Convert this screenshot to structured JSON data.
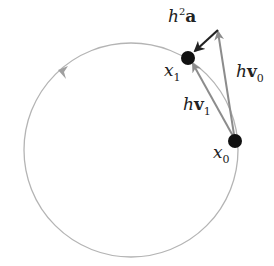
{
  "diagram": {
    "type": "orbit-integration-step",
    "colors": {
      "orbit": "#b4b4b4",
      "velocity_arrow": "#8c8c8c",
      "accel_arrow": "#222222",
      "point": "#111111",
      "background": "#ffffff"
    },
    "orbit": {
      "cx": 131,
      "cy": 150,
      "r": 107,
      "direction": "counterclockwise"
    },
    "points": [
      {
        "id": "x0",
        "label": "x",
        "subscript": "0",
        "x": 235,
        "y": 141
      },
      {
        "id": "x1",
        "label": "x",
        "subscript": "1",
        "x": 188,
        "y": 58
      }
    ],
    "vectors": [
      {
        "id": "hv0",
        "label_prefix": "h",
        "label_vec": "v",
        "subscript": "0",
        "from": "x0",
        "to": [
          218,
          30
        ]
      },
      {
        "id": "hv1",
        "label_prefix": "h",
        "label_vec": "v",
        "subscript": "1",
        "from": "x0",
        "to": "x1"
      },
      {
        "id": "h2a",
        "label_prefix": "h",
        "superscript": "2",
        "label_vec": "a",
        "from": [
          218,
          30
        ],
        "to": "x1"
      }
    ],
    "labels": {
      "h2a_h": "h",
      "h2a_sup": "2",
      "h2a_a": "a",
      "hv0_h": "h",
      "hv0_v": "v",
      "hv0_sub": "0",
      "hv1_h": "h",
      "hv1_v": "v",
      "hv1_sub": "1",
      "x0_x": "x",
      "x0_sub": "0",
      "x1_x": "x",
      "x1_sub": "1"
    }
  }
}
